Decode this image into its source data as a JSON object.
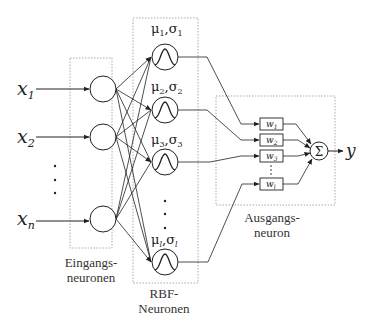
{
  "diagram": {
    "inputs": [
      {
        "id": "x1",
        "base": "x",
        "sub": "1"
      },
      {
        "id": "x2",
        "base": "x",
        "sub": "2"
      },
      {
        "id": "xn",
        "base": "x",
        "sub": "n"
      }
    ],
    "rbf_neurons": [
      {
        "id": "rbf1",
        "label_mu": "μ",
        "sub": "1",
        "label_sigma": "σ"
      },
      {
        "id": "rbf2",
        "label_mu": "μ",
        "sub": "2",
        "label_sigma": "σ"
      },
      {
        "id": "rbf3",
        "label_mu": "μ",
        "sub": "3",
        "label_sigma": "σ"
      },
      {
        "id": "rbfl",
        "label_mu": "μ",
        "sub": "l",
        "label_sigma": "σ"
      }
    ],
    "weights": [
      {
        "base": "w",
        "sub": "1"
      },
      {
        "base": "w",
        "sub": "2"
      },
      {
        "base": "w",
        "sub": "3"
      },
      {
        "base": "w",
        "sub": "l"
      }
    ],
    "sum_symbol": "Σ",
    "output": "y",
    "comma": ",",
    "captions": {
      "input_line1": "Eingangs-",
      "input_line2": "neuronen",
      "rbf_line1": "RBF-",
      "rbf_line2": "Neuronen",
      "output_line1": "Ausgangs-",
      "output_line2": "neuron"
    },
    "colors": {
      "stroke": "#222222",
      "dotted_box": "#aaaaaa",
      "background": "#ffffff"
    }
  }
}
